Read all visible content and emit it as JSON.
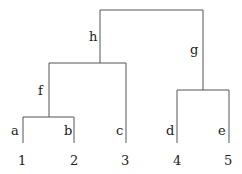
{
  "diagram": {
    "type": "dendrogram",
    "leaves": [
      {
        "id": "1",
        "edge_label": "a"
      },
      {
        "id": "2",
        "edge_label": "b"
      },
      {
        "id": "3",
        "edge_label": "c"
      },
      {
        "id": "4",
        "edge_label": "d"
      },
      {
        "id": "5",
        "edge_label": "e"
      }
    ],
    "internal_nodes": [
      {
        "id": "ab",
        "children": [
          "1",
          "2"
        ],
        "edge_label": "f"
      },
      {
        "id": "abc",
        "children": [
          "ab",
          "3"
        ],
        "edge_label": "h"
      },
      {
        "id": "de",
        "children": [
          "4",
          "5"
        ],
        "edge_label": "g"
      },
      {
        "id": "root",
        "children": [
          "abc",
          "de"
        ],
        "edge_label": ""
      }
    ],
    "labels": {
      "a": "a",
      "b": "b",
      "c": "c",
      "d": "d",
      "e": "e",
      "f": "f",
      "g": "g",
      "h": "h",
      "n1": "1",
      "n2": "2",
      "n3": "3",
      "n4": "4",
      "n5": "5"
    }
  }
}
